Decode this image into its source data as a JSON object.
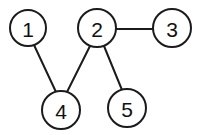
{
  "diagram": {
    "background_color": "#ffffff",
    "stroke_color": "#1b1b1b",
    "label_color": "#111111",
    "node_fill": "#ffffff",
    "width": 200,
    "height": 135
  },
  "chart_data": {
    "type": "diagram",
    "layout": "manual",
    "node_radius": 19,
    "directed": false,
    "nodes": [
      {
        "id": "1",
        "label": "1",
        "cx": 28,
        "cy": 28,
        "r": 18
      },
      {
        "id": "2",
        "label": "2",
        "cx": 97,
        "cy": 28,
        "r": 19
      },
      {
        "id": "3",
        "label": "3",
        "cx": 172,
        "cy": 28,
        "r": 19
      },
      {
        "id": "4",
        "label": "4",
        "cx": 61,
        "cy": 110,
        "r": 19
      },
      {
        "id": "5",
        "label": "5",
        "cx": 127,
        "cy": 108,
        "r": 19
      }
    ],
    "edges": [
      {
        "id": "edge-1-4",
        "source": "1",
        "target": "4",
        "x1": 34,
        "y1": 45,
        "x2": 56,
        "y2": 92
      },
      {
        "id": "edge-2-3",
        "source": "2",
        "target": "3",
        "x1": 116,
        "y1": 29,
        "x2": 153,
        "y2": 29
      },
      {
        "id": "edge-2-4",
        "source": "2",
        "target": "4",
        "x1": 90,
        "y1": 46,
        "x2": 67,
        "y2": 92
      },
      {
        "id": "edge-2-5",
        "source": "2",
        "target": "5",
        "x1": 104,
        "y1": 46,
        "x2": 122,
        "y2": 90
      }
    ],
    "legend": [],
    "annotations": []
  }
}
